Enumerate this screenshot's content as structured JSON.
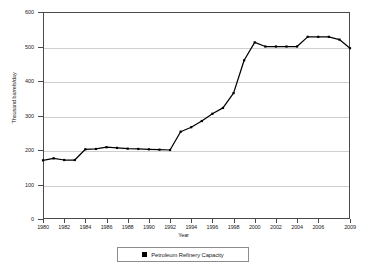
{
  "chart_data": {
    "type": "line",
    "title": "",
    "subtitle": "",
    "xlabel": "Year",
    "ylabel": "Thousand barrels/day",
    "xlim": [
      1980,
      2009
    ],
    "ylim": [
      0,
      600
    ],
    "ytick_step": 100,
    "yticks": [
      0,
      100,
      200,
      300,
      400,
      500,
      600
    ],
    "ytick_labels": [
      "0",
      "100",
      "200",
      "300",
      "400",
      "500",
      "600"
    ],
    "xticks": [
      1980,
      1982,
      1984,
      1986,
      1988,
      1990,
      1992,
      1994,
      1996,
      1998,
      2000,
      2002,
      2004,
      2006,
      2009
    ],
    "xtick_labels": [
      "1980",
      "1982",
      "1984",
      "1986",
      "1988",
      "1990",
      "1992",
      "1994",
      "1996",
      "1998",
      "2000",
      "2002",
      "2004",
      "2006",
      "2009"
    ],
    "grid": true,
    "grid_axis": "y",
    "legend_position": "bottom",
    "marker": "square",
    "line_color": "#000000",
    "grid_color": "#cfcfcf",
    "axis_color": "#4a4a4a",
    "x": [
      1980,
      1981,
      1982,
      1983,
      1984,
      1985,
      1986,
      1987,
      1988,
      1989,
      1990,
      1991,
      1992,
      1993,
      1994,
      1995,
      1996,
      1997,
      1998,
      1999,
      2000,
      2001,
      2002,
      2003,
      2004,
      2005,
      2006,
      2007,
      2008,
      2009
    ],
    "series": [
      {
        "name": "Petroleum Refinery Capacity",
        "values": [
          170,
          176,
          171,
          171,
          202,
          203,
          208,
          206,
          204,
          203,
          202,
          201,
          200,
          253,
          266,
          284,
          305,
          322,
          365,
          460,
          512,
          500,
          500,
          500,
          500,
          528,
          528,
          528,
          520,
          495
        ]
      }
    ],
    "legend": [
      {
        "label": "Petroleum Refinery Capacity",
        "color": "#000000",
        "marker": "square"
      }
    ]
  }
}
